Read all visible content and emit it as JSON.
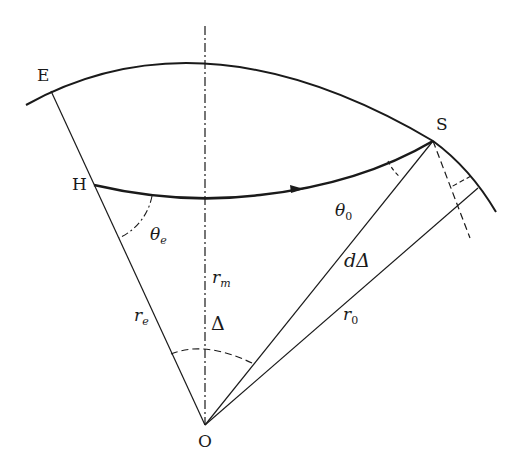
{
  "diagram": {
    "type": "geometry",
    "points": {
      "E": "E",
      "H": "H",
      "S": "S",
      "O": "O"
    },
    "labels": {
      "theta_e_sym": "θ",
      "theta_e_sub": "e",
      "theta_0_sym": "θ",
      "theta_0_sub": "0",
      "r_m_sym": "r",
      "r_m_sub": "m",
      "r_e_sym": "r",
      "r_e_sub": "e",
      "r_0_sym": "r",
      "r_0_sub": "0",
      "delta": "Δ",
      "d_delta": "dΔ"
    },
    "colors": {
      "stroke": "#1a1a1a",
      "background": "#ffffff"
    }
  }
}
